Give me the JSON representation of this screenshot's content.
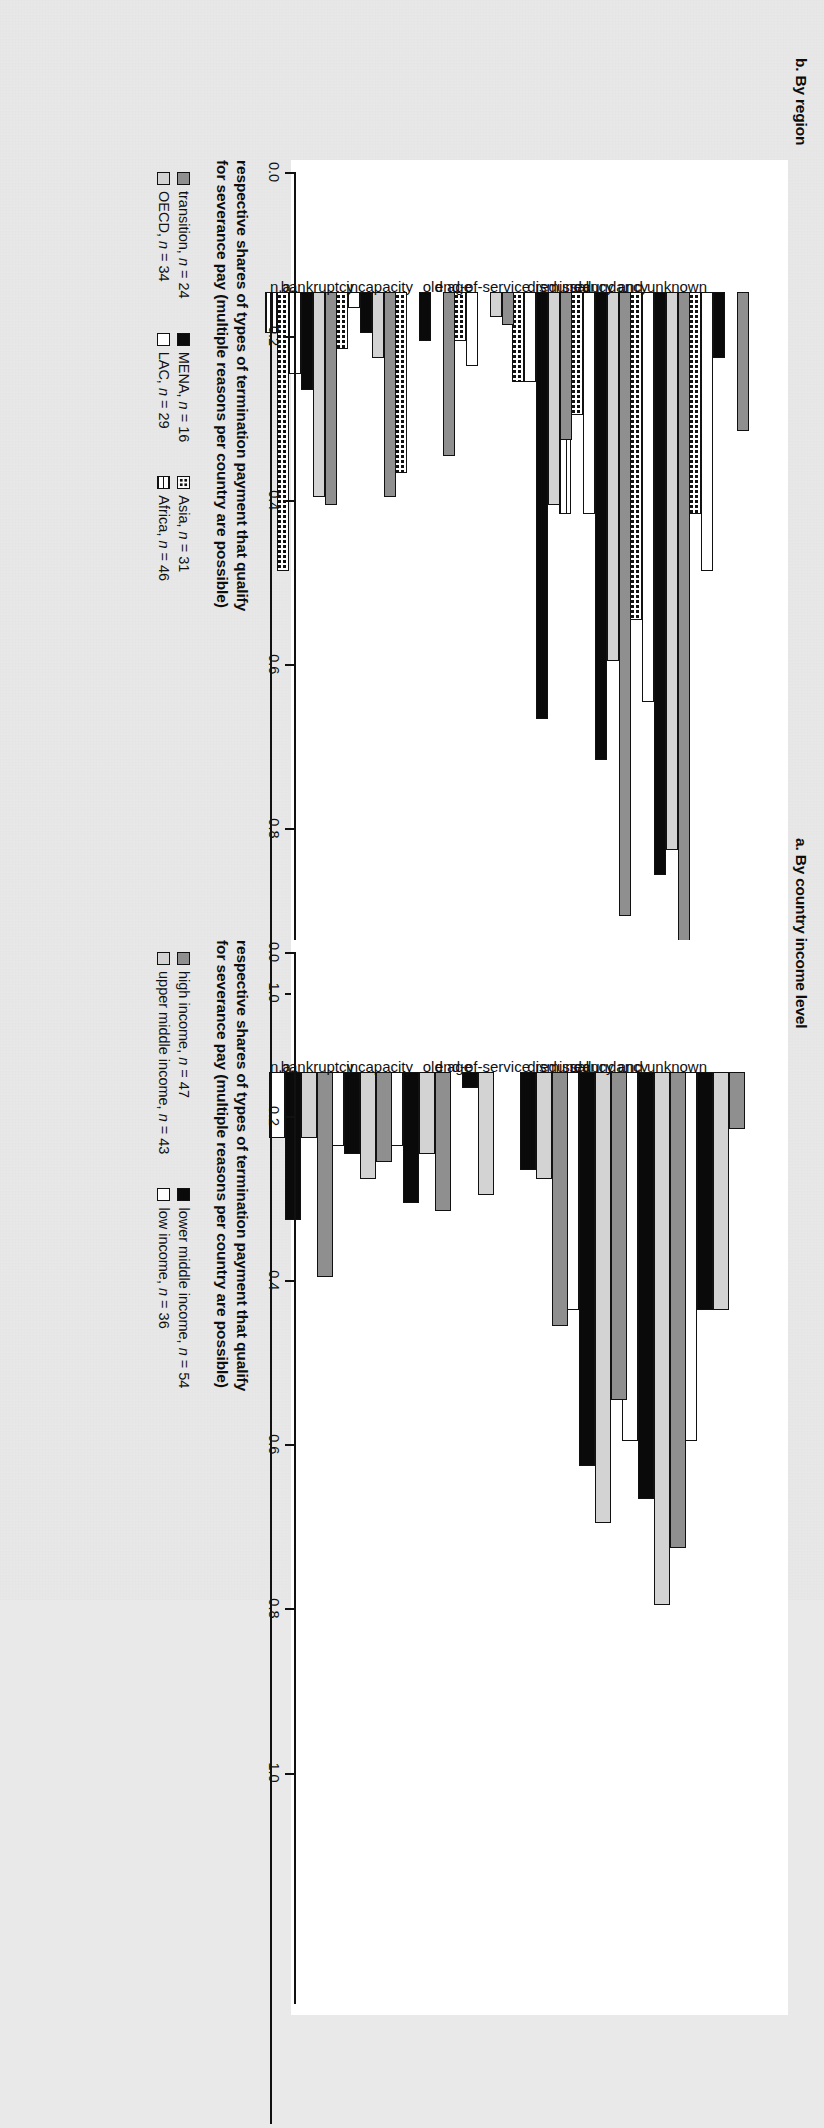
{
  "figure": {
    "panels": [
      {
        "id": "b",
        "title": "b. By region",
        "axis_title_line1": "respective shares of types of termination payment that qualify",
        "axis_title_line2": "for severance pay (multiple reasons per country are possible)"
      },
      {
        "id": "a",
        "title": "a. By country income level",
        "axis_title_line1": "respective shares of types of termination payment that qualify",
        "axis_title_line2": "for severance pay (multiple reasons per country are possible)"
      }
    ]
  },
  "chart_data": [
    {
      "type": "bar",
      "panel": "a",
      "title": "a. By country income level",
      "xlabel": "respective shares of types of termination payment that qualify for severance pay (multiple reasons per country are possible)",
      "ylabel": "",
      "orientation": "vertical-bars-rotated",
      "ylim": [
        0.0,
        1.0
      ],
      "ticks": [
        "0.0",
        "0.2",
        "0.4",
        "0.6",
        "0.8",
        "1.0"
      ],
      "tick_values": [
        0.0,
        0.2,
        0.4,
        0.6,
        0.8,
        1.0
      ],
      "grid": false,
      "legend_position": "below-axis",
      "categories": [
        "redundancy and unknown",
        "redundancy",
        "dismissal",
        "end-of-service",
        "old age",
        "incapacity",
        "bankruptcy",
        "n.a."
      ],
      "series": [
        {
          "name": "high income, n = 47",
          "n": 47,
          "color": "#8f8f8f",
          "pattern": "solid-dark-gray",
          "values": [
            0.07,
            0.58,
            0.4,
            0.31,
            0.0,
            0.17,
            0.11,
            0.25
          ]
        },
        {
          "name": "upper middle income, n = 43",
          "n": 43,
          "color": "#d3d3d3",
          "pattern": "solid-light-gray",
          "values": [
            0.29,
            0.65,
            0.55,
            0.13,
            0.15,
            0.1,
            0.13,
            0.08
          ]
        },
        {
          "name": "lower middle income, n = 54",
          "n": 54,
          "color": "#0a0a0a",
          "pattern": "solid-black",
          "values": [
            0.29,
            0.52,
            0.48,
            0.12,
            0.02,
            0.16,
            0.1,
            0.18
          ]
        },
        {
          "name": "low income, n = 36",
          "n": 36,
          "color": "#ffffff",
          "pattern": "open-white",
          "values": [
            0.45,
            0.45,
            0.29,
            0.0,
            0.0,
            0.09,
            0.09,
            0.08
          ]
        }
      ]
    },
    {
      "type": "bar",
      "panel": "b",
      "title": "b. By region",
      "xlabel": "respective shares of types of termination payment that qualify for severance pay (multiple reasons per country are possible)",
      "ylabel": "",
      "orientation": "vertical-bars-rotated",
      "ylim": [
        0.0,
        1.0
      ],
      "ticks": [
        "0.0",
        "0.2",
        "0.4",
        "0.6",
        "0.8",
        "1.0"
      ],
      "tick_values": [
        0.0,
        0.2,
        0.4,
        0.6,
        0.8,
        1.0
      ],
      "grid": false,
      "legend_position": "below-axis",
      "categories": [
        "redundancy and unknown",
        "redundancy",
        "dismissal",
        "end-of-service",
        "old age",
        "incapacity",
        "bankruptcy",
        "n.a."
      ],
      "series": [
        {
          "name": "transition, n = 24",
          "n": 24,
          "color": "#8f8f8f",
          "pattern": "solid-dark-gray",
          "values": [
            0.17,
            0.8,
            0.76,
            0.18,
            0.04,
            0.2,
            0.25,
            0.26
          ]
        },
        {
          "name": "OECD, n = 34",
          "n": 34,
          "color": "#d3d3d3",
          "pattern": "solid-light-gray",
          "values": [
            0.0,
            0.68,
            0.45,
            0.26,
            0.03,
            0.0,
            0.08,
            0.25
          ]
        },
        {
          "name": "MENA, n = 16",
          "n": 16,
          "color": "#0a0a0a",
          "pattern": "solid-black",
          "values": [
            0.08,
            0.71,
            0.57,
            0.52,
            0.0,
            0.06,
            0.05,
            0.12
          ]
        },
        {
          "name": "LAC, n = 29",
          "n": 29,
          "color": "#ffffff",
          "pattern": "open-white",
          "values": [
            0.34,
            0.5,
            0.27,
            0.11,
            0.09,
            0.0,
            0.02,
            0.1
          ]
        },
        {
          "name": "Asia, n = 31",
          "n": 31,
          "color": "#ffffff",
          "pattern": "dotted-checker",
          "values": [
            0.27,
            0.4,
            0.15,
            0.11,
            0.06,
            0.22,
            0.07,
            0.34
          ]
        },
        {
          "name": "Africa, n = 46",
          "n": 46,
          "color": "#ffffff",
          "pattern": "grid-hatch",
          "values": [
            0.42,
            0.41,
            0.27,
            0.0,
            0.0,
            0.04,
            0.07,
            0.05
          ]
        }
      ]
    }
  ]
}
